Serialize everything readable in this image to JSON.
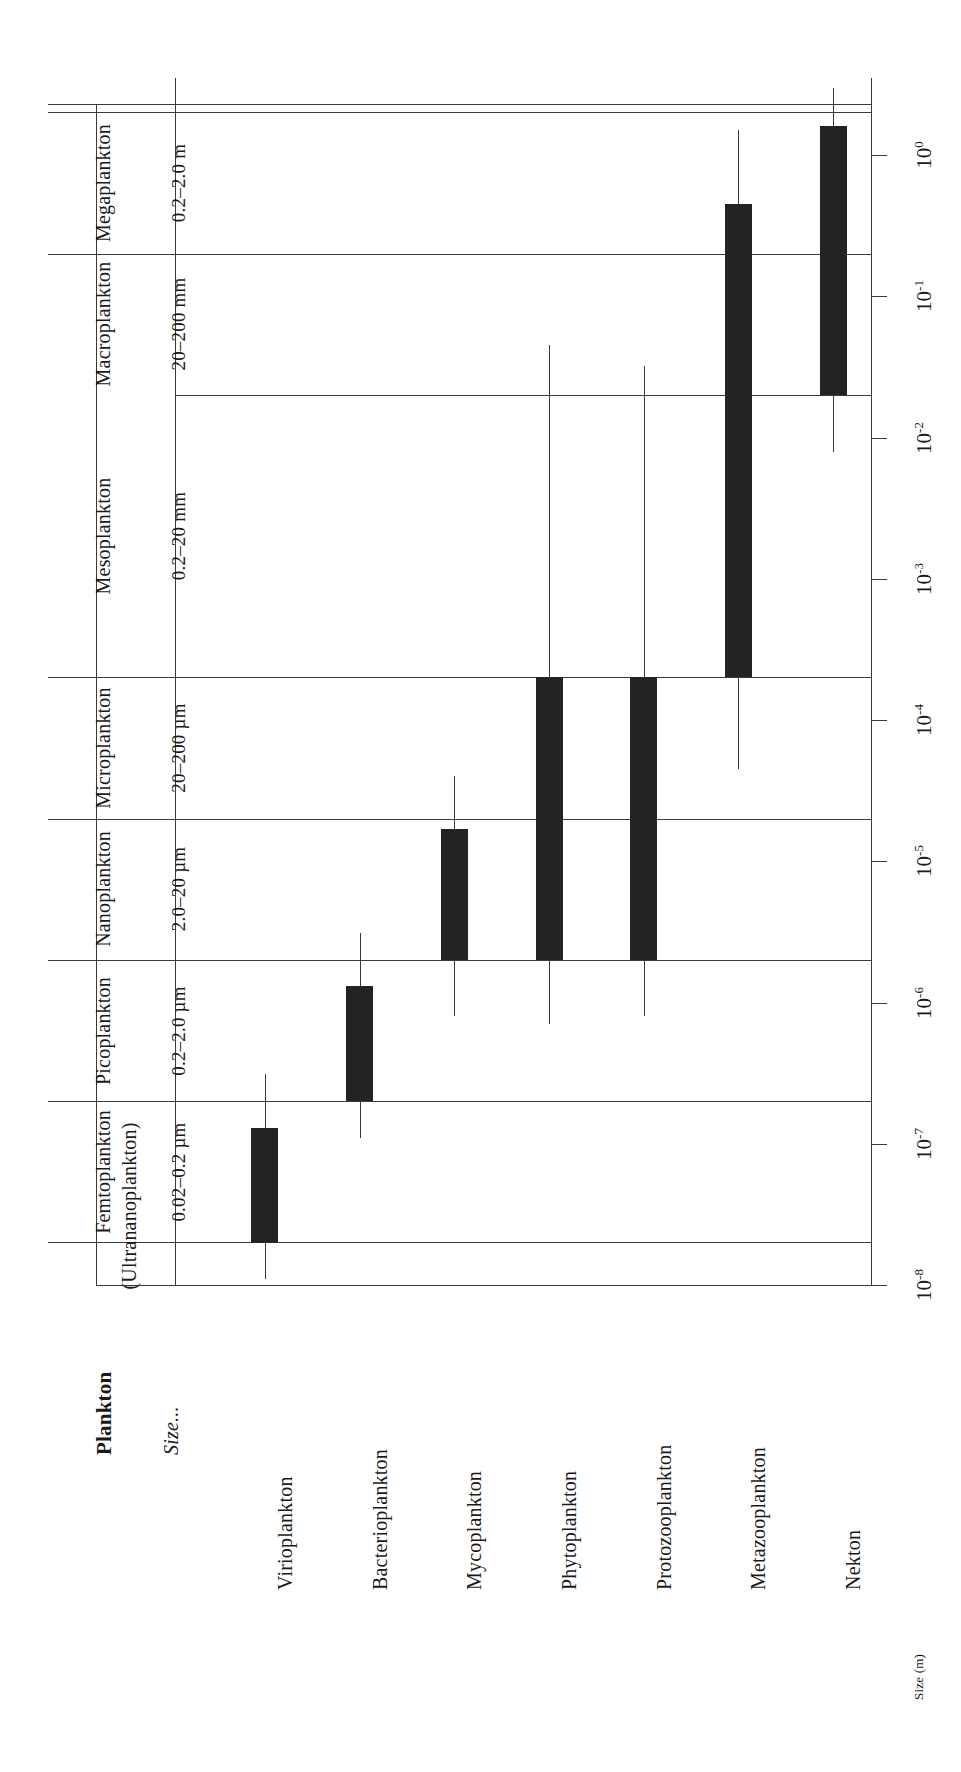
{
  "figure": {
    "header_label": "Plankton",
    "size_row_label": "Size...",
    "axis_label": "Size (m)",
    "orientation": "rotated-90-ccw",
    "ink_color": "#232323",
    "line_color": "#3a3a3a",
    "background": "#ffffff"
  },
  "chart_data": {
    "type": "bar",
    "xlabel": "Plankton",
    "ylabel": "Size (m)",
    "scale": "log10",
    "ylim": [
      1e-08,
      3.0
    ],
    "grid": true,
    "legend": "none",
    "tick_labels": [
      "10^0",
      "10^-1",
      "10^-2",
      "10^-3",
      "10^-4",
      "10^-5",
      "10^-6",
      "10^-7",
      "10^-8"
    ],
    "tick_values": [
      1,
      0.1,
      0.01,
      0.001,
      0.0001,
      1e-05,
      1e-06,
      1e-07,
      1e-08
    ],
    "tick_mantissa": [
      "10",
      "10",
      "10",
      "10",
      "10",
      "10",
      "10",
      "10",
      "10"
    ],
    "tick_exponents": [
      "0",
      "-1",
      "-2",
      "-3",
      "-4",
      "-5",
      "-6",
      "-7",
      "-8"
    ],
    "categories": [
      "Virioplankton",
      "Bacterioplankton",
      "Mycoplankton",
      "Phytoplankton",
      "Protozooplankton",
      "Metazooplankton",
      "Nekton"
    ],
    "series": [
      {
        "name": "Typical size range (box) and extended range (whisker)",
        "bars": [
          {
            "category": "Virioplankton",
            "box_low": 2e-08,
            "box_high": 1.3e-07,
            "whisker_low": 1.1e-08,
            "whisker_high": 3.1e-07
          },
          {
            "category": "Bacterioplankton",
            "box_low": 2e-07,
            "box_high": 1.3e-06,
            "whisker_low": 1.1e-07,
            "whisker_high": 3.1e-06
          },
          {
            "category": "Mycoplankton",
            "box_low": 2e-06,
            "box_high": 1.7e-05,
            "whisker_low": 8e-07,
            "whisker_high": 4e-05
          },
          {
            "category": "Phytoplankton",
            "box_low": 2e-06,
            "box_high": 0.0002,
            "whisker_low": 7e-07,
            "whisker_high": 0.045
          },
          {
            "category": "Protozooplankton",
            "box_low": 2e-06,
            "box_high": 0.0002,
            "whisker_low": 8e-07,
            "whisker_high": 0.032
          },
          {
            "category": "Metazooplankton",
            "box_low": 0.0002,
            "box_high": 0.45,
            "whisker_low": 4.5e-05,
            "whisker_high": 1.5
          },
          {
            "category": "Nekton",
            "box_low": 0.02,
            "box_high": 1.6,
            "whisker_low": 0.008,
            "whisker_high": 3.0
          }
        ]
      }
    ],
    "size_classes": [
      {
        "name": "Femtoplankton",
        "subtitle": "(Ultrananoplankton)",
        "range": "0.02–0.2 µm",
        "low": 2e-08,
        "high": 2e-07
      },
      {
        "name": "Picoplankton",
        "subtitle": "",
        "range": "0.2–2.0 µm",
        "low": 2e-07,
        "high": 2e-06
      },
      {
        "name": "Nanoplankton",
        "subtitle": "",
        "range": "2.0–20 µm",
        "low": 2e-06,
        "high": 2e-05
      },
      {
        "name": "Microplankton",
        "subtitle": "",
        "range": "20–200 µm",
        "low": 2e-05,
        "high": 0.0002
      },
      {
        "name": "Mesoplankton",
        "subtitle": "",
        "range": "0.2–20 mm",
        "low": 0.0002,
        "high": 0.02
      },
      {
        "name": "Macroplankton",
        "subtitle": "",
        "range": "20–200 mm",
        "low": 0.02,
        "high": 0.2
      },
      {
        "name": "Megaplankton",
        "subtitle": "",
        "range": "0.2–2.0 m",
        "low": 0.2,
        "high": 2.0
      }
    ]
  }
}
